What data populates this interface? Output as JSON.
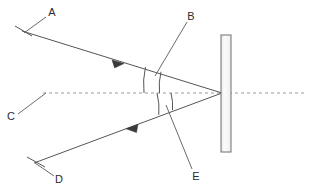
{
  "figure": {
    "type": "ray-optics-reflection-diagram",
    "background_color": "#ffffff",
    "stroke_color": "#555555",
    "label_color": "#2b2b2b",
    "mirror_fill": "#f2f2f2",
    "width": 313,
    "height": 191
  },
  "labels": {
    "a": "A",
    "b": "B",
    "c": "C",
    "d": "D",
    "e": "E"
  },
  "elements": {
    "incident_ray": {
      "label_ref": "A",
      "start": [
        22,
        31
      ],
      "end": [
        222,
        93
      ],
      "arrow_at": [
        119,
        62
      ],
      "arrow_direction": "toward-mirror"
    },
    "reflected_ray": {
      "label_ref": "D",
      "start": [
        222,
        93
      ],
      "end": [
        34,
        163
      ],
      "arrow_at": [
        131,
        127
      ],
      "arrow_direction": "away-from-mirror"
    },
    "normal_line": {
      "label_ref": "C",
      "style": "dashed",
      "start": [
        43,
        93
      ],
      "end": [
        305,
        93
      ]
    },
    "mirror": {
      "x": 221,
      "y": 35,
      "width": 10,
      "height": 117
    },
    "angle_incidence_arcs": {
      "label_ref": "B",
      "count": 2
    },
    "angle_reflection_arcs": {
      "label_ref": "E",
      "count": 2
    }
  },
  "leaders": {
    "a": {
      "from": [
        46,
        17
      ],
      "to": [
        24,
        33
      ]
    },
    "b": {
      "from": [
        187,
        20
      ],
      "to": [
        155,
        75
      ]
    },
    "c": {
      "from": [
        17,
        116
      ],
      "to": [
        45,
        93
      ]
    },
    "d": {
      "from": [
        55,
        178
      ],
      "to": [
        34,
        163
      ]
    },
    "e": {
      "from": [
        193,
        175
      ],
      "to": [
        166,
        106
      ]
    }
  }
}
